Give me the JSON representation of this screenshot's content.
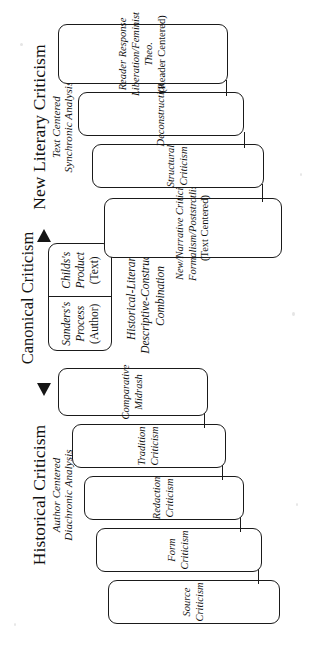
{
  "diagram": {
    "center": {
      "title": "Canonical Criticism",
      "cells": [
        {
          "name": "Sanders's",
          "aspect": "Process",
          "focus": "(Author)"
        },
        {
          "name": "Childs's",
          "aspect": "Product",
          "focus": "(Text)"
        }
      ],
      "notes": [
        "Historical-Literary",
        "Descriptive-Constructive",
        "Combination"
      ]
    },
    "left_branch": {
      "heading": "Historical Criticism",
      "sub1": "Author Centered",
      "sub2": "Diachronic Analysis",
      "arrow": "arrow-left",
      "boxes": [
        {
          "lines": [
            "Source Criticism"
          ]
        },
        {
          "lines": [
            "Form Criticism"
          ]
        },
        {
          "lines": [
            "Redaction Criticism"
          ]
        },
        {
          "lines": [
            "Tradition Criticism"
          ]
        },
        {
          "lines": [
            "Comparative Midrash"
          ]
        }
      ]
    },
    "right_branch": {
      "heading": "New Literary Criticism",
      "sub1": "Text Centered",
      "sub2": "Synchronic Analysis",
      "arrow": "arrow-right",
      "boxes": [
        {
          "lines": [
            "New/Narrative Criticism",
            "Formalism/Poststrctlism."
          ],
          "paren": "(Text Centered)"
        },
        {
          "lines": [
            "Structural Criticism"
          ]
        },
        {
          "lines": [
            "Deconstruction"
          ]
        },
        {
          "lines": [
            "Reader Response",
            "Liberation/Feminist Theo."
          ],
          "paren": "(Reader Centered)"
        }
      ]
    }
  }
}
